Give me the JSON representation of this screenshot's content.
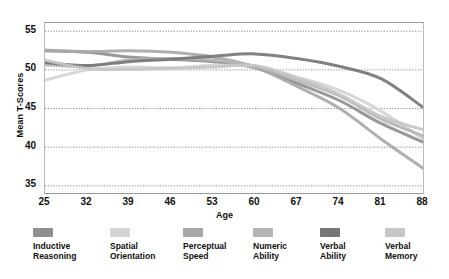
{
  "chart_data": {
    "type": "line",
    "title": "",
    "xlabel": "Age",
    "ylabel": "Mean T-Scores",
    "x": [
      25,
      32,
      39,
      46,
      53,
      60,
      67,
      74,
      81,
      88
    ],
    "xticklabels": [
      "25",
      "32",
      "39",
      "46",
      "53",
      "60",
      "67",
      "74",
      "81",
      "88"
    ],
    "yticklabels": [
      "35",
      "40",
      "45",
      "50",
      "55"
    ],
    "yticks": [
      35,
      40,
      45,
      50,
      55
    ],
    "ylim": [
      34,
      56
    ],
    "xlim": [
      25,
      88
    ],
    "grid": "horizontal-dotted",
    "legend_position": "bottom",
    "series": [
      {
        "name": "Inductive Reasoning",
        "color": "#8f8f8f",
        "values": [
          52.4,
          52.2,
          51.6,
          51.3,
          51.0,
          50.2,
          48.2,
          46.0,
          43.0,
          40.6
        ]
      },
      {
        "name": "Spatial Orientation",
        "color": "#d4d4d4",
        "values": [
          48.6,
          49.9,
          50.3,
          50.2,
          50.5,
          50.4,
          49.0,
          47.3,
          44.6,
          41.0
        ]
      },
      {
        "name": "Perceptual Speed",
        "color": "#a8a8a8",
        "values": [
          52.5,
          52.3,
          52.4,
          52.2,
          51.6,
          50.3,
          47.8,
          45.0,
          41.0,
          37.2
        ]
      },
      {
        "name": "Numeric Ability",
        "color": "#b5b5b5",
        "values": [
          50.6,
          50.4,
          51.2,
          51.4,
          51.2,
          50.4,
          48.6,
          46.6,
          43.6,
          41.4
        ]
      },
      {
        "name": "Verbal Ability",
        "color": "#767676",
        "values": [
          50.9,
          50.5,
          51.0,
          51.3,
          51.7,
          52.0,
          51.4,
          50.4,
          48.8,
          45.1
        ]
      },
      {
        "name": "Verbal Memory",
        "color": "#c6c6c6",
        "values": [
          51.2,
          50.1,
          50.0,
          50.1,
          50.3,
          50.5,
          48.9,
          46.8,
          43.9,
          42.2
        ]
      }
    ]
  },
  "legend": {
    "items": [
      {
        "label_line1": "Inductive",
        "label_line2": "Reasoning",
        "color": "#8f8f8f"
      },
      {
        "label_line1": "Spatial",
        "label_line2": "Orientation",
        "color": "#d4d4d4"
      },
      {
        "label_line1": "Perceptual",
        "label_line2": "Speed",
        "color": "#a8a8a8"
      },
      {
        "label_line1": "Numeric",
        "label_line2": "Ability",
        "color": "#b5b5b5"
      },
      {
        "label_line1": "Verbal",
        "label_line2": "Ability",
        "color": "#767676"
      },
      {
        "label_line1": "Verbal",
        "label_line2": "Memory",
        "color": "#c6c6c6"
      }
    ]
  }
}
